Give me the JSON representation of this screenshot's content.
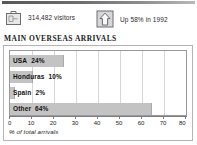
{
  "header": {
    "rule_color": "#58585a"
  },
  "stats": [
    {
      "icon": "suitcase-icon",
      "label": "314,482 visitors"
    },
    {
      "icon": "up-arrow-icon",
      "label": "Up 58% in 1992"
    }
  ],
  "chart_data": {
    "type": "bar",
    "orientation": "horizontal",
    "title": "MAIN OVERSEAS ARRIVALS",
    "categories": [
      "USA",
      "Honduras",
      "Spain",
      "Other"
    ],
    "values": [
      24,
      10,
      2,
      64
    ],
    "value_labels": [
      "24%",
      "10%",
      "2%",
      "64%"
    ],
    "xlabel": "% of total arrivals",
    "ylabel": "",
    "xlim": [
      0,
      80
    ],
    "xticks": [
      0,
      10,
      20,
      30,
      40,
      50,
      60,
      70,
      80
    ],
    "xtick_labels": [
      "0",
      "10",
      "20",
      "30",
      "40",
      "50",
      "60",
      "70",
      "80"
    ],
    "grid": true,
    "legend": false,
    "bar_color": "#c3c3c3",
    "plot_background": "#ffffff"
  }
}
